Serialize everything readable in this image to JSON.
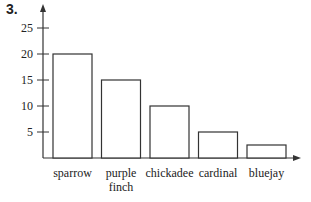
{
  "problem_number": "3.",
  "chart_data": {
    "type": "bar",
    "title": "",
    "xlabel": "",
    "ylabel": "",
    "categories": [
      "sparrow",
      "purple finch",
      "chickadee",
      "cardinal",
      "bluejay"
    ],
    "category_lines": [
      [
        "sparrow"
      ],
      [
        "purple",
        "finch"
      ],
      [
        "chickadee"
      ],
      [
        "cardinal"
      ],
      [
        "bluejay"
      ]
    ],
    "values": [
      20,
      15,
      10,
      5,
      2.5
    ],
    "yticks": [
      5,
      10,
      15,
      20,
      25
    ],
    "ylim": [
      0,
      27
    ],
    "grid": false,
    "legend": null
  },
  "colors": {
    "axis": "#333333",
    "bar_fill": "#ffffff",
    "bar_stroke": "#333333",
    "text": "#222222"
  }
}
